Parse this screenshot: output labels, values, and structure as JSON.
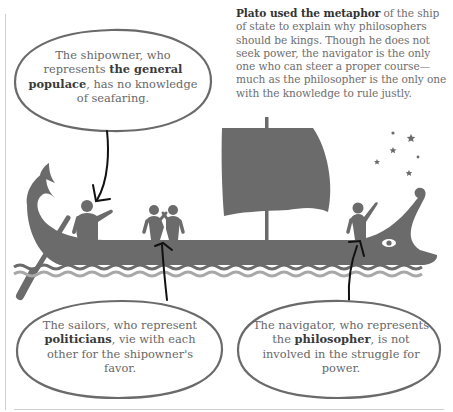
{
  "intro": {
    "bold_lead": "Plato used the metaphor",
    "rest": " of the ship of state to explain why philosophers should be kings. Though he does not seek power, the navigator is the only one who can steer a proper course—much as the philosopher is the only one with the knowledge to rule justly."
  },
  "bubbles": [
    {
      "id": "shipowner",
      "before": "The shipowner, who represents ",
      "bold": "the general populace",
      "after": ", has no knowledge of seafaring."
    },
    {
      "id": "sailors",
      "before": "The sailors, who represent ",
      "bold": "politicians",
      "after": ", vie with each other for the shipowner's favor."
    },
    {
      "id": "navigator",
      "before": "The navigator, who represents the ",
      "bold": "philosopher",
      "after": ", is not involved in the struggle for power."
    }
  ],
  "illustration": {
    "subject": "ship-of-state",
    "figures": [
      "shipowner",
      "sailor-1",
      "sailor-2",
      "navigator"
    ],
    "colors": {
      "ship": "#6b6b6b",
      "wave_light": "#a8a8a8",
      "arrow": "#111111",
      "bubble_outline": "#6a6a6a"
    }
  }
}
